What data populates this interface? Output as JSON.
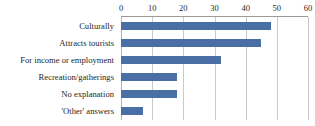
{
  "chart_data": {
    "type": "bar",
    "orientation": "horizontal",
    "title": "",
    "xlabel": "",
    "ylabel": "",
    "categories": [
      "Culturally",
      "Attracts tourists",
      "For income or employment",
      "Recreation/gatherings",
      "No explanation",
      "'Other' answers"
    ],
    "values": [
      48,
      45,
      32,
      18,
      18,
      7
    ],
    "xlim": [
      0,
      60
    ],
    "xticks": [
      0,
      10,
      20,
      30,
      40,
      50,
      60
    ],
    "xtick_labels": [
      "0",
      "10",
      "20",
      "30",
      "40",
      "50",
      "60"
    ],
    "axis_position": "top",
    "grid": "vertical",
    "legend": "none",
    "bar_color": "#4a6fa4",
    "gridline_color": "#c9c9c9",
    "axis_line_color": "#9a9a9a",
    "background_color": "#ffffff"
  }
}
